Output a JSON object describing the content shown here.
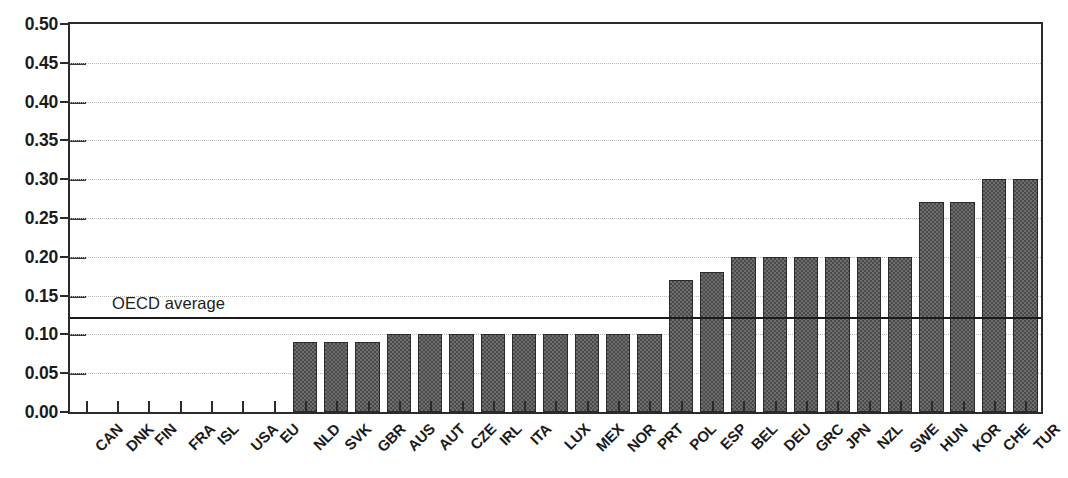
{
  "chart_data": {
    "type": "bar",
    "title": "",
    "subtitle": "",
    "xlabel": "",
    "ylabel": "",
    "ylim": [
      0.0,
      0.5
    ],
    "ytick_labels": [
      "0.50",
      "0.45",
      "0.40",
      "0.35",
      "0.30",
      "0.25",
      "0.20",
      "0.15",
      "0.10",
      "0.05",
      "0.00"
    ],
    "ytick_values": [
      0.5,
      0.45,
      0.4,
      0.35,
      0.3,
      0.25,
      0.2,
      0.15,
      0.1,
      0.05,
      0.0
    ],
    "grid": true,
    "legend_position": "none",
    "categories": [
      "CAN",
      "DNK",
      "FIN",
      "FRA",
      "ISL",
      "USA",
      "EU",
      "NLD",
      "SVK",
      "GBR",
      "AUS",
      "AUT",
      "CZE",
      "IRL",
      "ITA",
      "LUX",
      "MEX",
      "NOR",
      "PRT",
      "POL",
      "ESP",
      "BEL",
      "DEU",
      "GRC",
      "JPN",
      "NZL",
      "SWE",
      "HUN",
      "KOR",
      "CHE",
      "TUR"
    ],
    "values": [
      0.0,
      0.0,
      0.0,
      0.0,
      0.0,
      0.0,
      0.0,
      0.09,
      0.09,
      0.09,
      0.1,
      0.1,
      0.1,
      0.1,
      0.1,
      0.1,
      0.1,
      0.1,
      0.1,
      0.17,
      0.18,
      0.2,
      0.2,
      0.2,
      0.2,
      0.2,
      0.2,
      0.27,
      0.27,
      0.3,
      0.3
    ],
    "series": [
      {
        "name": "value",
        "values": [
          0.0,
          0.0,
          0.0,
          0.0,
          0.0,
          0.0,
          0.0,
          0.09,
          0.09,
          0.09,
          0.1,
          0.1,
          0.1,
          0.1,
          0.1,
          0.1,
          0.1,
          0.1,
          0.1,
          0.17,
          0.18,
          0.2,
          0.2,
          0.2,
          0.2,
          0.2,
          0.2,
          0.27,
          0.27,
          0.3,
          0.3
        ]
      }
    ],
    "annotations": [
      {
        "name": "oecd-average",
        "label": "OECD average",
        "value": 0.123,
        "type": "hline"
      }
    ],
    "colors": {
      "bar_fill": "#6e6e6e",
      "bar_pattern": "#4a4a4a",
      "bar_border": "#2a2a2a",
      "axis": "#2b2b2b",
      "gridline": "#b9b9b9",
      "annotation_line": "#1b1b1b",
      "text": "#1b1b1b",
      "background": "#ffffff"
    }
  }
}
